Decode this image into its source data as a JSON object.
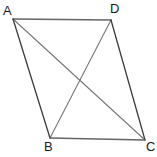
{
  "figure": {
    "kind": "geometry-diagram",
    "shape_name": "parallelogram",
    "canvas": {
      "width": 157,
      "height": 157,
      "background": "#ffffff"
    },
    "stroke": {
      "edge_color": "#555555",
      "edge_color_dark": "#3c3c3c",
      "diagonal_color": "#777777",
      "width": 1.2
    },
    "vertices": [
      {
        "id": "A",
        "label": "A",
        "x": 13,
        "y": 19,
        "label_x": 3,
        "label_y": 4
      },
      {
        "id": "D",
        "label": "D",
        "x": 111,
        "y": 20,
        "label_x": 110,
        "label_y": 2
      },
      {
        "id": "B",
        "label": "B",
        "x": 50,
        "y": 138,
        "label_x": 44,
        "label_y": 140
      },
      {
        "id": "C",
        "label": "C",
        "x": 145,
        "y": 140,
        "label_x": 146,
        "label_y": 140
      }
    ],
    "edges": [
      {
        "id": "AD",
        "from": "A",
        "to": "D",
        "role": "side",
        "x1": 13,
        "y1": 19,
        "x2": 111,
        "y2": 20
      },
      {
        "id": "AB",
        "from": "A",
        "to": "B",
        "role": "side",
        "x1": 13,
        "y1": 19,
        "x2": 50,
        "y2": 138
      },
      {
        "id": "DC",
        "from": "D",
        "to": "C",
        "role": "side",
        "x1": 111,
        "y1": 20,
        "x2": 145,
        "y2": 140
      },
      {
        "id": "BC",
        "from": "B",
        "to": "C",
        "role": "side",
        "x1": 50,
        "y1": 138,
        "x2": 145,
        "y2": 140
      }
    ],
    "diagonals": [
      {
        "id": "AC",
        "from": "A",
        "to": "C",
        "role": "diagonal",
        "x1": 13,
        "y1": 19,
        "x2": 145,
        "y2": 140
      },
      {
        "id": "BD",
        "from": "B",
        "to": "D",
        "role": "diagonal",
        "x1": 50,
        "y1": 138,
        "x2": 111,
        "y2": 20
      }
    ],
    "intersection": {
      "id": "diagonal-crossing",
      "x": 78,
      "y": 80,
      "visible_marker": false
    }
  }
}
